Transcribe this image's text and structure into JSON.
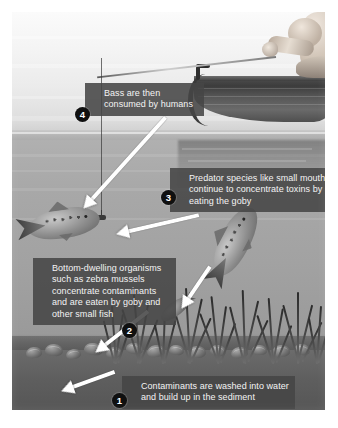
{
  "figure": {
    "kind": "food-chain-bioaccumulation-diagram",
    "palette": {
      "callout_background": "#464646",
      "callout_text": "#f4f4f4",
      "badge_background": "#101010",
      "badge_text": "#ffffff",
      "arrow": "#ffffff",
      "sky": "#f4f4f4",
      "water": "#a4a4a4",
      "sediment": "#5e5e5e",
      "page_background": "#ffffff"
    },
    "callouts": [
      {
        "number": "1",
        "text": "Contaminants are washed into water and build up in the sediment"
      },
      {
        "number": "2",
        "text": "Bottom-dwelling organisms such as zebra mussels concentrate contaminants and are eaten by goby and other small fish"
      },
      {
        "number": "3",
        "text": "Predator species like small mouth bass continue to concentrate toxins by eating the goby"
      },
      {
        "number": "4",
        "text": "Bass are then consumed by humans"
      }
    ],
    "scene": {
      "angler": "fisherman-in-rowboat",
      "boat": "rowboat",
      "rod": "fishing-rod-with-line-and-sinker",
      "fish": [
        "smallmouth-bass-hooked",
        "smallmouth-bass-swimming",
        "round-goby"
      ],
      "bed": "sediment-with-zebra-mussels",
      "plants": "aquatic-weeds"
    }
  }
}
